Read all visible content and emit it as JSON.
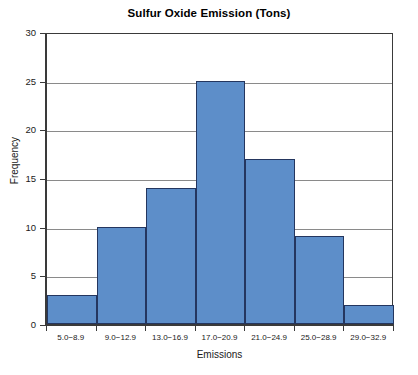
{
  "chart_data": {
    "type": "bar",
    "title": "Sulfur Oxide Emission (Tons)",
    "xlabel": "Emissions",
    "ylabel": "Frequency",
    "categories": [
      "5.0−8.9",
      "9.0−12.9",
      "13.0−16.9",
      "17.0−20.9",
      "21.0−24.9",
      "25.0−28.9",
      "29.0−32.9"
    ],
    "values": [
      3,
      10,
      14,
      25,
      17,
      9,
      2
    ],
    "ylim": [
      0,
      30
    ],
    "ytick_labels": [
      "0",
      "5",
      "10",
      "15",
      "20",
      "25",
      "30"
    ],
    "ytick_values": [
      0,
      5,
      10,
      15,
      20,
      25,
      30
    ],
    "grid": "horizontal",
    "legend": "none",
    "bar_fill_color": "#5d8ec9",
    "bar_border_color": "#24365f",
    "gridline_color": "#8a8a8a",
    "axis_color": "#3a3a3a",
    "background_color": "#ffffff"
  }
}
